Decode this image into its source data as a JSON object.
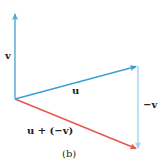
{
  "diagram": {
    "caption": "(b)",
    "origin": [
      15,
      99
    ],
    "vectors": [
      {
        "id": "v",
        "label": "v",
        "from": [
          15,
          99
        ],
        "to": [
          15,
          13
        ],
        "color": "#4fa6d8"
      },
      {
        "id": "u",
        "label": "u",
        "from": [
          15,
          99
        ],
        "to": [
          137,
          66
        ],
        "color": "#3a9fd6"
      },
      {
        "id": "neg_v",
        "label": "−v",
        "from": [
          138,
          66
        ],
        "to": [
          138,
          149
        ],
        "color": "#9fd3ef"
      },
      {
        "id": "u_plus_neg_v",
        "label": "u + (−v)",
        "from": [
          15,
          99
        ],
        "to": [
          137,
          149
        ],
        "color": "#e4574f"
      }
    ],
    "labels": {
      "v": "v",
      "u": "u",
      "neg_v": "−v",
      "sum": "u + (−v)",
      "caption": "(b)"
    }
  }
}
